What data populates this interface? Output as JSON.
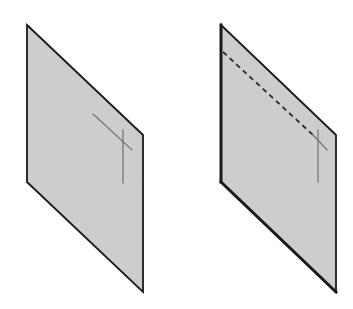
{
  "diagram": {
    "colors": {
      "plane_fill": "#cdcdcd",
      "plane_edge": "#1a1a1a",
      "mark_line": "#707070",
      "dashed_line": "#2a2a2a",
      "background": "#ffffff"
    },
    "panels": [
      {
        "id": "left-plane",
        "polygon": [
          [
            27,
            25
          ],
          [
            143,
            135
          ],
          [
            143,
            292
          ],
          [
            27,
            182
          ]
        ],
        "edge_width": 1.8,
        "cross": {
          "diagonal": [
            [
              93,
              114
            ],
            [
              132,
              150
            ]
          ],
          "vertical": [
            [
              123,
              130
            ],
            [
              123,
              183
            ]
          ]
        }
      },
      {
        "id": "right-plane",
        "polygon": [
          [
            221,
            25
          ],
          [
            336,
            135
          ],
          [
            336,
            292
          ],
          [
            221,
            182
          ]
        ],
        "edge_width": 1.8,
        "thick_edges": [
          [
            [
              221,
              25
            ],
            [
              221,
              182
            ]
          ],
          [
            [
              221,
              182
            ],
            [
              336,
              292
            ]
          ]
        ],
        "thick_edge_width": 3,
        "dashed": [
          [
            223,
            52
          ],
          [
            313,
            135
          ]
        ],
        "cross": {
          "diagonal": [
            [
              313,
              135
            ],
            [
              327,
              150
            ]
          ],
          "vertical": [
            [
              318,
              130
            ],
            [
              318,
              182
            ]
          ]
        }
      }
    ]
  }
}
